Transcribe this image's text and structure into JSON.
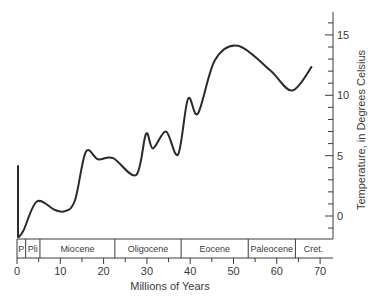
{
  "chart_data": {
    "type": "line",
    "title": "",
    "xlabel": "Millions of Years",
    "ylabel": "Temperature, in Degrees Celsius",
    "xlim": [
      0,
      72
    ],
    "ylim": [
      -2,
      17
    ],
    "x_ticks": [
      0,
      10,
      20,
      30,
      40,
      50,
      60,
      70
    ],
    "y_ticks": [
      0,
      5,
      10,
      15
    ],
    "y_axis_position": "right",
    "grid": false,
    "legend": null,
    "series": [
      {
        "name": "Temperature",
        "x": [
          0.2,
          1.5,
          4.6,
          8.8,
          11.1,
          13.4,
          15.9,
          18.7,
          22.2,
          27.5,
          29.8,
          31.4,
          34.4,
          37.2,
          39.5,
          41.8,
          45.7,
          51.0,
          58.4,
          63.5,
          68.1
        ],
        "values": [
          -1.8,
          -1.2,
          1.2,
          0.5,
          0.4,
          1.3,
          5.3,
          4.7,
          4.8,
          3.4,
          6.8,
          5.6,
          7.0,
          5.1,
          9.7,
          8.5,
          12.9,
          14.1,
          12.1,
          10.4,
          12.4
        ]
      }
    ],
    "annotations": [
      {
        "type": "vertical-line",
        "x": 0.2,
        "from": -1.8,
        "to": 4.2,
        "note": "present-day spike"
      }
    ],
    "epochs": [
      {
        "label": "P",
        "start": 0,
        "end": 2
      },
      {
        "label": "Pli",
        "start": 2,
        "end": 5.3
      },
      {
        "label": "Miocene",
        "start": 5.3,
        "end": 22.6
      },
      {
        "label": "Oligocene",
        "start": 22.6,
        "end": 37.9
      },
      {
        "label": "Eocene",
        "start": 37.9,
        "end": 53.4
      },
      {
        "label": "Paleocene",
        "start": 53.4,
        "end": 64.3
      },
      {
        "label": "Cret.",
        "start": 64.3,
        "end": 72.7
      }
    ]
  }
}
